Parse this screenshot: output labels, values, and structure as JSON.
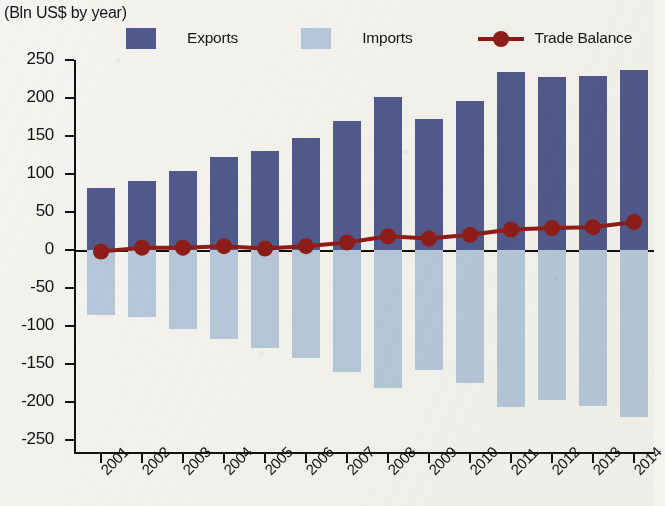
{
  "header": {
    "title": "",
    "subtitle": "(Bln US$ by year)"
  },
  "legend": {
    "exports_label": "Exports",
    "imports_label": "Imports",
    "balance_label": "Trade Balance",
    "exports_color": "#515a8c",
    "imports_color": "#b6c8da",
    "balance_color": "#8e1d18"
  },
  "axis": {
    "y_ticks": [
      "250",
      "200",
      "150",
      "100",
      "50",
      "0",
      "-50",
      "-100",
      "-150",
      "-200",
      "-250"
    ],
    "x_labels": [
      "2001",
      "2002",
      "2003",
      "2004",
      "2005",
      "2006",
      "2007",
      "2008",
      "2009",
      "2010",
      "2011",
      "2012",
      "2013",
      "2014"
    ]
  },
  "chart_data": {
    "type": "bar",
    "title": "",
    "subtitle": "(Bln US$ by year)",
    "xlabel": "",
    "ylabel": "Bln US$",
    "ylim": [
      -250,
      250
    ],
    "ytick_step": 50,
    "grid": false,
    "legend_position": "top",
    "categories": [
      "2001",
      "2002",
      "2003",
      "2004",
      "2005",
      "2006",
      "2007",
      "2008",
      "2009",
      "2010",
      "2011",
      "2012",
      "2013",
      "2014"
    ],
    "series": [
      {
        "name": "Exports",
        "type": "bar",
        "color": "#515a8c",
        "values": [
          81,
          91,
          104,
          122,
          130,
          147,
          170,
          201,
          172,
          196,
          234,
          227,
          229,
          237
        ]
      },
      {
        "name": "Imports",
        "type": "bar",
        "color": "#b6c8da",
        "values": [
          -85,
          -88,
          -104,
          -117,
          -129,
          -142,
          -160,
          -182,
          -158,
          -175,
          -207,
          -198,
          -205,
          -220
        ]
      },
      {
        "name": "Trade Balance",
        "type": "line",
        "color": "#8e1d18",
        "values": [
          -2,
          3,
          3,
          5,
          2,
          5,
          10,
          18,
          15,
          20,
          27,
          29,
          30,
          37
        ]
      }
    ]
  }
}
